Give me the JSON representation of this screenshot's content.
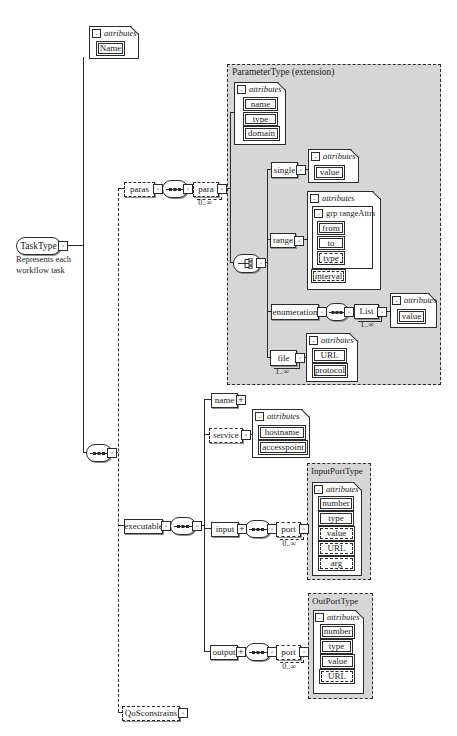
{
  "shared": {
    "attributes_label": "attributes",
    "collapse_glyph": "-",
    "expand_glyph": "+"
  },
  "root": {
    "label": "TaskType",
    "annotation_line1": "Represents each",
    "annotation_line2": "workflow task"
  },
  "task_attributes": {
    "item": "Name"
  },
  "paras": {
    "label": "paras",
    "para_label": "para",
    "occurs": "0..∞"
  },
  "parameter_type": {
    "title": "ParameterType (extension)",
    "attrs": {
      "items": [
        "name",
        "type",
        "domain"
      ]
    },
    "single": {
      "label": "single",
      "value": "value"
    },
    "range": {
      "label": "range",
      "group_label": "grp rangeAttrs",
      "items": [
        "from",
        "to",
        "type"
      ],
      "interval": "interval"
    },
    "enumeration": {
      "label": "enumeration",
      "list_label": "List",
      "occurs": "1..∞",
      "value": "value"
    },
    "file": {
      "label": "file",
      "occurs": "1..∞",
      "items": [
        "URL",
        "protocol"
      ]
    }
  },
  "executable": {
    "label": "executable",
    "name_label": "name",
    "service": {
      "label": "service",
      "items": [
        "hostname",
        "accesspoint"
      ]
    },
    "input": {
      "label": "input",
      "port_label": "port",
      "occurs": "0..∞"
    },
    "input_type": {
      "title": "InputPortType",
      "items": [
        "number",
        "type",
        "value",
        "URL",
        "arg"
      ]
    },
    "output": {
      "label": "output",
      "port_label": "port",
      "occurs": "0..∞"
    },
    "output_type": {
      "title": "OutPortType",
      "items": [
        "number",
        "type",
        "value",
        "URL"
      ]
    }
  },
  "qos": {
    "label": "QoSconstrains"
  },
  "colors": {
    "type_box_fill": "#d6d6d6",
    "line": "#2b2b2b",
    "background": "#ffffff"
  }
}
